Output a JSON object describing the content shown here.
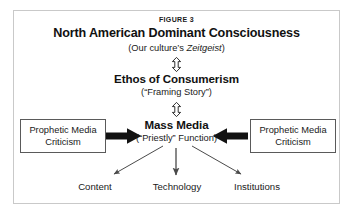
{
  "figure": {
    "label": "FIGURE 3",
    "frame_color": "#c9c9c9",
    "background": "#ffffff",
    "text_color": "#1a1a1a"
  },
  "nodes": {
    "consciousness": {
      "title": "North American Dominant Consciousness",
      "subtitle_prefix": "(Our culture’s ",
      "subtitle_italic": "Zeitgeist",
      "subtitle_suffix": ")"
    },
    "ethos": {
      "title": "Ethos of Consumerism",
      "subtitle": "(“Framing Story”)"
    },
    "mass_media": {
      "title": "Mass Media",
      "subtitle": "(“Priestly” Function)"
    },
    "left_box": {
      "line1": "Prophetic Media",
      "line2": "Criticism"
    },
    "right_box": {
      "line1": "Prophetic Media",
      "line2": "Criticism"
    }
  },
  "outputs": [
    {
      "label": "Content"
    },
    {
      "label": "Technology"
    },
    {
      "label": "Institutions"
    }
  ],
  "connectors": [
    {
      "name": "consciousness-ethos",
      "style": "hollow-double-vertical",
      "color": "#1a1a1a"
    },
    {
      "name": "ethos-mass-media",
      "style": "hollow-double-vertical",
      "color": "#1a1a1a"
    },
    {
      "name": "left-criticism-to-mass-media",
      "style": "solid-block-right",
      "color": "#111111"
    },
    {
      "name": "right-criticism-to-mass-media",
      "style": "solid-block-left",
      "color": "#111111"
    },
    {
      "name": "mass-media-to-content",
      "style": "thin-diagonal-left",
      "color": "#4a4a4a"
    },
    {
      "name": "mass-media-to-technology",
      "style": "thin-vertical",
      "color": "#4a4a4a"
    },
    {
      "name": "mass-media-to-institutions",
      "style": "thin-diagonal-right",
      "color": "#4a4a4a"
    }
  ]
}
